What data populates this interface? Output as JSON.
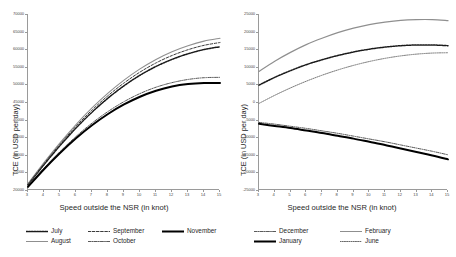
{
  "chart_data": [
    {
      "id": "left",
      "type": "line",
      "title": "",
      "xlabel": "Speed outside the NSR (in knot)",
      "ylabel": "TCE (in USD per day)",
      "xlim": [
        3,
        15
      ],
      "ylim": [
        20000,
        70000
      ],
      "xticks": [
        3,
        4,
        5,
        6,
        7,
        8,
        9,
        10,
        11,
        12,
        13,
        14,
        15
      ],
      "yticks": [
        20000,
        25000,
        30000,
        35000,
        40000,
        45000,
        50000,
        55000,
        60000,
        65000,
        70000
      ],
      "ytick_labels": [
        "20000",
        "25000",
        "30000",
        "35000",
        "40000",
        "45000",
        "50000",
        "55000",
        "60000",
        "65000",
        "70000"
      ],
      "grid": false,
      "legend_position": "bottom",
      "x": [
        3,
        4,
        5,
        6,
        7,
        8,
        9,
        10,
        11,
        12,
        13,
        14,
        15
      ],
      "series": [
        {
          "name": "July",
          "style": "dotted-bold",
          "color": "#1a1a1a",
          "width": 1.5,
          "dash": "1.6 1.1",
          "values": [
            21500,
            27200,
            32600,
            37600,
            42100,
            46100,
            49600,
            52600,
            55100,
            57100,
            58700,
            59900,
            60700
          ]
        },
        {
          "name": "August",
          "style": "solid-gray",
          "color": "#8f8f8f",
          "width": 1.1,
          "dash": "",
          "values": [
            21800,
            27800,
            33400,
            38600,
            43300,
            47500,
            51200,
            54400,
            57100,
            59300,
            61000,
            62300,
            63100
          ]
        },
        {
          "name": "September",
          "style": "dashed-sparse",
          "color": "#3a3a3a",
          "width": 1.0,
          "dash": "2.6 1.6",
          "values": [
            21650,
            27500,
            33000,
            38100,
            42700,
            46800,
            50400,
            53500,
            56100,
            58200,
            59850,
            61100,
            61900
          ]
        },
        {
          "name": "October",
          "style": "dash-dot",
          "color": "#5a5a5a",
          "width": 1.0,
          "dash": "3 1.2 0.8 1.2",
          "values": [
            21100,
            26200,
            30900,
            35200,
            39000,
            42300,
            45100,
            47400,
            49200,
            50500,
            51400,
            51900,
            52000
          ]
        },
        {
          "name": "November",
          "style": "solid-bold",
          "color": "#000000",
          "width": 2.0,
          "dash": "",
          "values": [
            20900,
            25900,
            30500,
            34700,
            38400,
            41600,
            44300,
            46500,
            48200,
            49400,
            50100,
            50400,
            50400
          ]
        }
      ]
    },
    {
      "id": "right",
      "type": "line",
      "title": "",
      "xlabel": "Speed outside the NSR (in knot)",
      "ylabel": "TCE (in USD per day)",
      "xlim": [
        3,
        15
      ],
      "ylim": [
        -25000,
        25000
      ],
      "xticks": [
        3,
        4,
        5,
        6,
        7,
        8,
        9,
        10,
        11,
        12,
        13,
        14,
        15
      ],
      "yticks": [
        -25000,
        -20000,
        -15000,
        -10000,
        -5000,
        0,
        5000,
        10000,
        15000,
        20000,
        25000
      ],
      "ytick_labels": [
        "-25000",
        "-20000",
        "-15000",
        "-10000",
        "-5000",
        "0",
        "5000",
        "10000",
        "15000",
        "20000",
        "25000"
      ],
      "grid": false,
      "legend_position": "bottom",
      "x": [
        3,
        4,
        5,
        6,
        7,
        8,
        9,
        10,
        11,
        12,
        13,
        14,
        15
      ],
      "series": [
        {
          "name": "December",
          "style": "dash-dot",
          "color": "#555555",
          "width": 1.0,
          "dash": "3 1.2 0.8 1.2",
          "values": [
            -5800,
            -6300,
            -6900,
            -7500,
            -8200,
            -8900,
            -9700,
            -10500,
            -11300,
            -12200,
            -13100,
            -14000,
            -15000
          ]
        },
        {
          "name": "January",
          "style": "solid-bold",
          "color": "#000000",
          "width": 2.0,
          "dash": "",
          "values": [
            -6200,
            -6800,
            -7400,
            -8100,
            -8800,
            -9600,
            -10400,
            -11300,
            -12200,
            -13200,
            -14200,
            -15200,
            -16300
          ]
        },
        {
          "name": "February",
          "style": "solid-gray",
          "color": "#8f8f8f",
          "width": 1.2,
          "dash": "",
          "values": [
            8700,
            11600,
            14100,
            16300,
            18100,
            19700,
            21000,
            22000,
            22700,
            23200,
            23400,
            23400,
            23100
          ]
        },
        {
          "name": "June",
          "style": "dotted-fine",
          "color": "#6a6a6a",
          "width": 0.9,
          "dash": "1.1 1.1",
          "values": [
            -400,
            1900,
            4000,
            5900,
            7600,
            9100,
            10400,
            11500,
            12400,
            13100,
            13600,
            13900,
            14000
          ]
        }
      ],
      "extra_series": [
        {
          "name": "February-inner",
          "style": "dotted-bold",
          "color": "#1a1a1a",
          "width": 1.5,
          "dash": "1.6 1.1",
          "values": [
            4800,
            7000,
            8900,
            10600,
            12000,
            13200,
            14200,
            15000,
            15600,
            16000,
            16200,
            16200,
            16000
          ]
        }
      ]
    }
  ],
  "panels": {
    "left": {
      "legend": [
        {
          "label": "July",
          "swatch": "dotted-bold"
        },
        {
          "label": "August",
          "swatch": "solid-gray"
        },
        {
          "label": "September",
          "swatch": "dashed-sparse"
        },
        {
          "label": "October",
          "swatch": "dash-dot"
        },
        {
          "label": "November",
          "swatch": "solid-bold"
        }
      ]
    },
    "right": {
      "legend": [
        {
          "label": "December",
          "swatch": "dash-dot"
        },
        {
          "label": "January",
          "swatch": "solid-bold"
        },
        {
          "label": "February",
          "swatch": "solid-gray"
        },
        {
          "label": "June",
          "swatch": "dotted-fine"
        }
      ]
    }
  }
}
